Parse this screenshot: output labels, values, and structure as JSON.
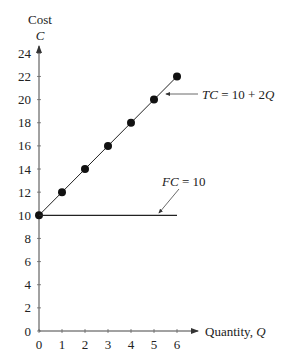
{
  "chart_data": {
    "type": "line",
    "title": "",
    "ylabel": "Cost",
    "ylabel_symbol": "C",
    "xlabel": "Quantity, ",
    "xlabel_symbol": "Q",
    "xlim": [
      0,
      6
    ],
    "ylim": [
      0,
      24
    ],
    "xticks": [
      "0",
      "1",
      "2",
      "3",
      "4",
      "5",
      "6"
    ],
    "yticks": [
      "0",
      "2",
      "4",
      "6",
      "8",
      "10",
      "12",
      "14",
      "16",
      "18",
      "20",
      "22",
      "24"
    ],
    "grid": false,
    "series": [
      {
        "name": "TC = 10 + 2Q",
        "label_parts": [
          "TC",
          " = 10 + 2",
          "Q"
        ],
        "x": [
          0,
          1,
          2,
          3,
          4,
          5,
          6
        ],
        "y": [
          10,
          12,
          14,
          16,
          18,
          20,
          22
        ],
        "markers": true
      },
      {
        "name": "FC = 10",
        "label_parts": [
          "FC",
          " = 10"
        ],
        "x": [
          0,
          6
        ],
        "y": [
          10,
          10
        ],
        "markers": false
      }
    ],
    "annotations": [
      {
        "text": "TC = 10 + 2Q",
        "points_to": [
          5.3,
          20.6
        ]
      },
      {
        "text": "FC = 10",
        "points_to": [
          5.0,
          10.1
        ]
      }
    ]
  }
}
